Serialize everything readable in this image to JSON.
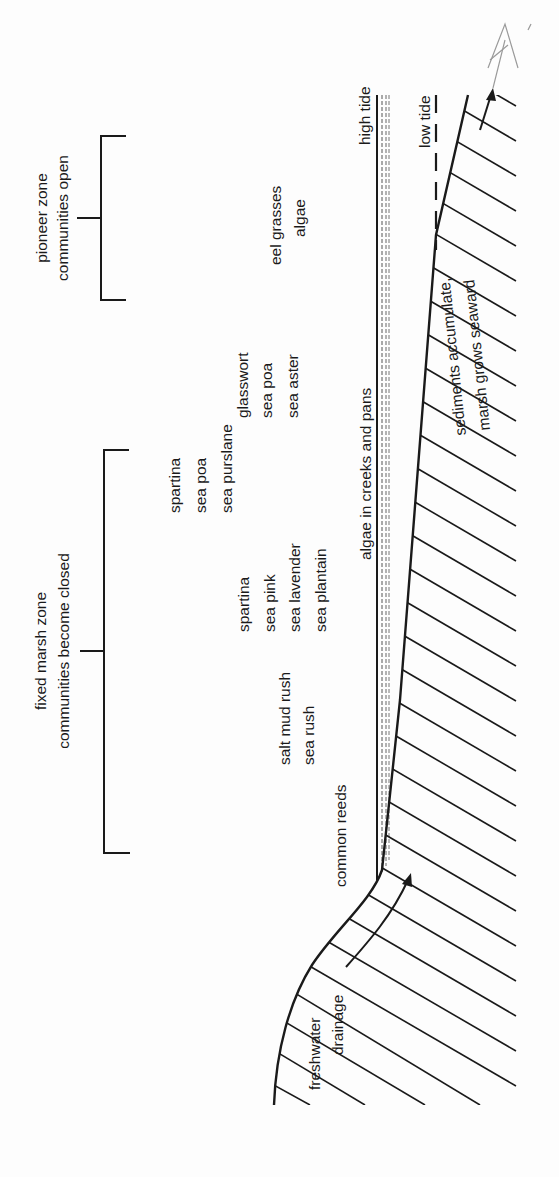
{
  "diagram": {
    "type": "salt-marsh-cross-section",
    "orientation": "rotated 90 degrees clockwise (text reads bottom-to-top)",
    "zones": {
      "pioneer": {
        "line1": "pioneer zone",
        "line2": "communities open"
      },
      "fixed": {
        "line1": "fixed marsh zone",
        "line2": "communities become closed"
      }
    },
    "plant_groups": [
      {
        "lines": [
          "eel grasses",
          "algae"
        ]
      },
      {
        "lines": [
          "glasswort",
          "sea poa",
          "sea aster"
        ]
      },
      {
        "lines": [
          "spartina",
          "sea poa",
          "sea purslane"
        ]
      },
      {
        "lines": [
          "spartina",
          "sea pink",
          "sea lavender",
          "sea plantain"
        ]
      },
      {
        "lines": [
          "salt mud rush",
          "sea rush"
        ]
      },
      {
        "lines": [
          "common reeds"
        ]
      }
    ],
    "labels": {
      "high_tide": "high tide",
      "low_tide": "low tide",
      "algae_creeks": "algae in creeks and pans",
      "sediments_1": "sediments accumulate,",
      "sediments_2": "marsh grows seaward",
      "freshwater_1": "freshwater",
      "freshwater_2": "drainage"
    },
    "colors": {
      "ink": "#1a1a1a",
      "paper": "#fdfdfd",
      "pencil": "#9a9a9a"
    }
  }
}
